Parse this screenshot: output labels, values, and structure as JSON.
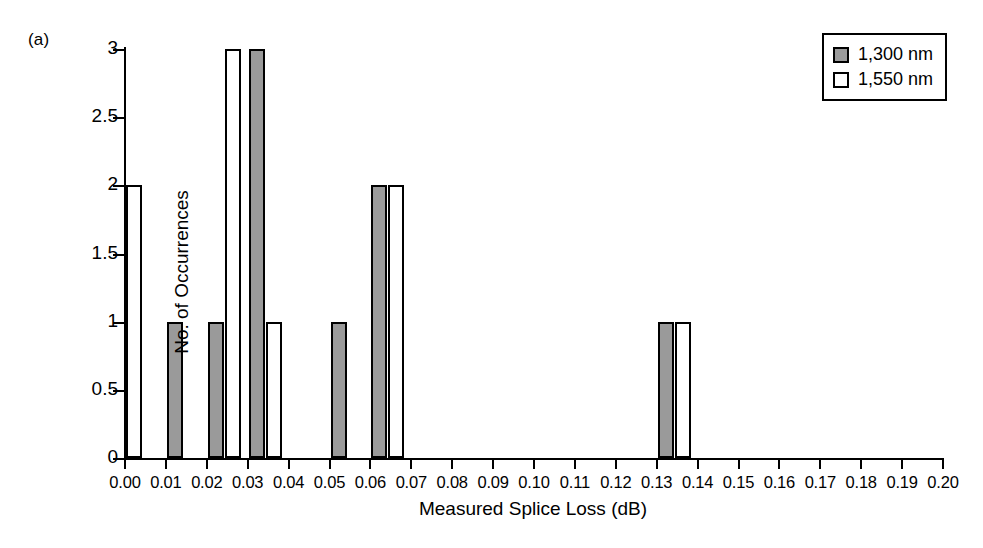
{
  "panel_label": "(a)",
  "legend": {
    "position": "top-right",
    "entries": [
      {
        "label": "1,300 nm",
        "swatch": "gray-filled-square",
        "color": "#9a9a9a"
      },
      {
        "label": "1,550 nm",
        "swatch": "white-open-square",
        "color": "#ffffff"
      }
    ]
  },
  "chart_data": {
    "type": "bar",
    "title": "",
    "subtitle": "",
    "xlabel": "Measured Splice Loss (dB)",
    "ylabel": "No. of Occurrences",
    "xlim": [
      0.0,
      0.2
    ],
    "ylim": [
      0,
      3
    ],
    "xticks": [
      "0.00",
      "0.01",
      "0.02",
      "0.03",
      "0.04",
      "0.05",
      "0.06",
      "0.07",
      "0.08",
      "0.09",
      "0.10",
      "0.11",
      "0.12",
      "0.13",
      "0.14",
      "0.15",
      "0.16",
      "0.17",
      "0.18",
      "0.19",
      "0.20"
    ],
    "xtick_values": [
      0.0,
      0.01,
      0.02,
      0.03,
      0.04,
      0.05,
      0.06,
      0.07,
      0.08,
      0.09,
      0.1,
      0.11,
      0.12,
      0.13,
      0.14,
      0.15,
      0.16,
      0.17,
      0.18,
      0.19,
      0.2
    ],
    "yticks": [
      "0",
      "0.5",
      "1",
      "1.5",
      "2",
      "2.5",
      "3"
    ],
    "ytick_values": [
      0,
      0.5,
      1,
      1.5,
      2,
      2.5,
      3
    ],
    "grid": false,
    "annotations": [
      "(a)"
    ],
    "categories": [
      0.0,
      0.01,
      0.02,
      0.03,
      0.04,
      0.05,
      0.06,
      0.07,
      0.08,
      0.09,
      0.1,
      0.11,
      0.12,
      0.13,
      0.14,
      0.15,
      0.16,
      0.17,
      0.18,
      0.19,
      0.2
    ],
    "series": [
      {
        "name": "1,300 nm",
        "color": "#9a9a9a",
        "values": [
          0,
          1,
          1,
          3,
          0,
          1,
          2,
          0,
          0,
          0,
          0,
          0,
          0,
          1,
          0,
          0,
          0,
          0,
          0,
          0,
          0
        ]
      },
      {
        "name": "1,550 nm",
        "color": "#ffffff",
        "values": [
          2,
          0,
          3,
          1,
          0,
          0,
          2,
          0,
          0,
          0,
          0,
          0,
          0,
          1,
          0,
          0,
          0,
          0,
          0,
          0,
          0
        ]
      }
    ],
    "bars": [
      {
        "bin": 0.0,
        "series": "1,550 nm",
        "value": 2,
        "slot": 0
      },
      {
        "bin": 0.01,
        "series": "1,300 nm",
        "value": 1,
        "slot": 0
      },
      {
        "bin": 0.02,
        "series": "1,300 nm",
        "value": 1,
        "slot": 0
      },
      {
        "bin": 0.02,
        "series": "1,550 nm",
        "value": 3,
        "slot": 1
      },
      {
        "bin": 0.03,
        "series": "1,300 nm",
        "value": 3,
        "slot": 0
      },
      {
        "bin": 0.03,
        "series": "1,550 nm",
        "value": 1,
        "slot": 1
      },
      {
        "bin": 0.05,
        "series": "1,300 nm",
        "value": 1,
        "slot": 0
      },
      {
        "bin": 0.06,
        "series": "1,300 nm",
        "value": 2,
        "slot": 0
      },
      {
        "bin": 0.06,
        "series": "1,550 nm",
        "value": 2,
        "slot": 1
      },
      {
        "bin": 0.13,
        "series": "1,300 nm",
        "value": 1,
        "slot": 0
      },
      {
        "bin": 0.13,
        "series": "1,550 nm",
        "value": 1,
        "slot": 1
      }
    ]
  }
}
